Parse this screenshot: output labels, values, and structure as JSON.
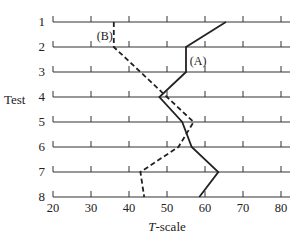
{
  "chart_data": {
    "type": "line",
    "title": "",
    "xlabel": "T-scale",
    "xlabel_italic_part": "T",
    "xlabel_rest": "-scale",
    "ylabel": "Test",
    "xlim": [
      20,
      83
    ],
    "xticks": [
      20,
      30,
      40,
      50,
      60,
      70,
      80
    ],
    "categories": [
      "1",
      "2",
      "3",
      "4",
      "5",
      "6",
      "7",
      "8"
    ],
    "series": [
      {
        "name": "(A)",
        "style": "solid",
        "values": [
          65.5,
          55,
          55,
          48,
          54,
          56.5,
          63.5,
          58.5
        ]
      },
      {
        "name": "(B)",
        "style": "dashed",
        "values": [
          36,
          36,
          43,
          50,
          57,
          53,
          43,
          44
        ]
      }
    ],
    "annotations": [
      {
        "text": "(A)",
        "x": 56,
        "row": 2.5
      },
      {
        "text": "(B)",
        "x": 31.5,
        "row": 1.5
      }
    ],
    "grid": "horizontal lines per test with tick marks"
  }
}
